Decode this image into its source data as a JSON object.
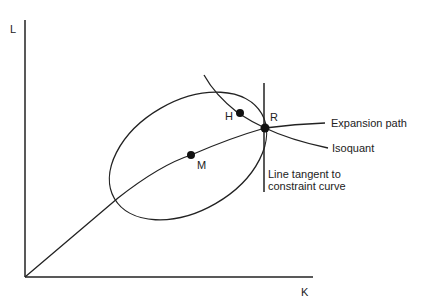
{
  "diagram": {
    "axes": {
      "y_label": "L",
      "x_label": "K"
    },
    "points": [
      {
        "id": "H",
        "label": "H"
      },
      {
        "id": "M",
        "label": "M"
      },
      {
        "id": "R",
        "label": "R"
      }
    ],
    "curve_labels": {
      "expansion_path": "Expansion path",
      "isoquant": "Isoquant",
      "tangent_line_1": "Line tangent to",
      "tangent_line_2": "constraint curve"
    },
    "colors": {
      "ink": "#222222",
      "background": "#ffffff"
    }
  }
}
